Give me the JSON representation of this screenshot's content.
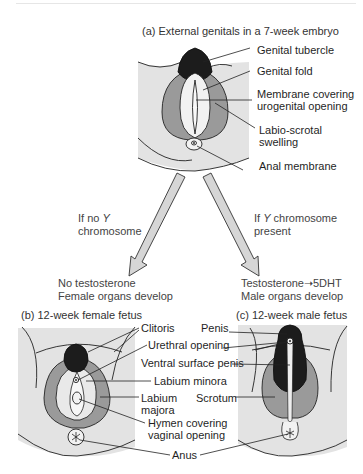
{
  "panel_a": {
    "title": "(a) External genitals in a 7-week embryo",
    "labels": {
      "genital_tubercle": "Genital tubercle",
      "genital_fold": "Genital fold",
      "membrane_line1": "Membrane covering",
      "membrane_line2": "urogenital opening",
      "labio_line1": "Labio-scrotal",
      "labio_line2": "swelling",
      "anal_membrane": "Anal membrane"
    }
  },
  "branches": {
    "left": {
      "condition_prefix": "If no ",
      "condition_italic": "Y",
      "condition_line2": "chromosome",
      "outcome_line1": "No testosterone",
      "outcome_line2": "Female organs develop"
    },
    "right": {
      "condition_prefix": "If ",
      "condition_italic": "Y",
      "condition_suffix": " chromosome",
      "condition_line2": "present",
      "outcome_line1": "Testosterone➝5DHT",
      "outcome_line2": "Male organs develop"
    }
  },
  "panel_b": {
    "title": "(b) 12-week female fetus",
    "labels": {
      "clitoris": "Clitoris",
      "urethral_opening": "Urethral opening",
      "labium_minora": "Labium minora",
      "labium_majora_line1": "Labium",
      "labium_majora_line2": "majora",
      "hymen_line1": "Hymen covering",
      "hymen_line2": "vaginal opening",
      "anus": "Anus"
    }
  },
  "panel_c": {
    "title": "(c) 12-week male fetus",
    "labels": {
      "penis": "Penis",
      "ventral_surface": "Ventral surface penis",
      "scrotum": "Scrotum"
    }
  },
  "colors": {
    "skin": "#e3e3e3",
    "mid_gray": "#9a9a9a",
    "dark": "#1c1c1c",
    "light_inner": "#f2f2f2",
    "arrow_fill": "#d6d6d6"
  }
}
